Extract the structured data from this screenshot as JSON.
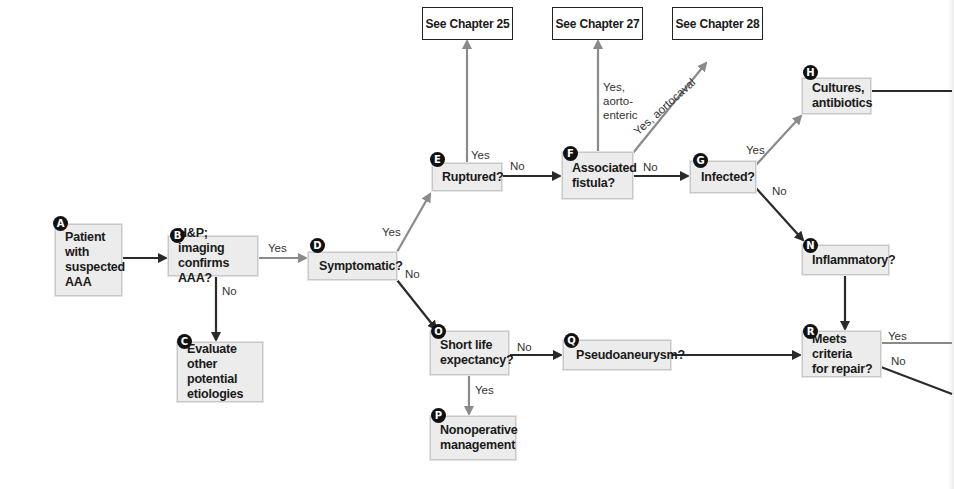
{
  "diagram": {
    "type": "flowchart",
    "nodes": [
      {
        "id": "A",
        "label": "Patient with suspected AAA",
        "lines": [
          "Patient",
          "with",
          "suspected",
          "AAA"
        ]
      },
      {
        "id": "B",
        "label": "H&P; imaging confirms AAA?",
        "lines": [
          "H&P; imaging",
          "confirms AAA?"
        ]
      },
      {
        "id": "C",
        "label": "Evaluate other potential etiologies",
        "lines": [
          "Evaluate other",
          "potential",
          "etiologies"
        ]
      },
      {
        "id": "D",
        "label": "Symptomatic?",
        "lines": [
          "Symptomatic?"
        ]
      },
      {
        "id": "E",
        "label": "Ruptured?",
        "lines": [
          "Ruptured?"
        ]
      },
      {
        "id": "F",
        "label": "Associated fistula?",
        "lines": [
          "Associated",
          "fistula?"
        ]
      },
      {
        "id": "G",
        "label": "Infected?",
        "lines": [
          "Infected?"
        ]
      },
      {
        "id": "H",
        "label": "Cultures, antibiotics",
        "lines": [
          "Cultures,",
          "antibiotics"
        ]
      },
      {
        "id": "N",
        "label": "Inflammatory?",
        "lines": [
          "Inflammatory?"
        ]
      },
      {
        "id": "O",
        "label": "Short life expectancy?",
        "lines": [
          "Short life",
          "expectancy?"
        ]
      },
      {
        "id": "P",
        "label": "Nonoperative management",
        "lines": [
          "Nonoperative",
          "management"
        ]
      },
      {
        "id": "Q",
        "label": "Pseudoaneurysm?",
        "lines": [
          "Pseudoaneurysm?"
        ]
      },
      {
        "id": "R",
        "label": "Meets criteria for repair?",
        "lines": [
          "Meets criteria",
          "for repair?"
        ]
      }
    ],
    "references": [
      {
        "id": "ch25",
        "label": "See Chapter 25"
      },
      {
        "id": "ch27",
        "label": "See Chapter 27"
      },
      {
        "id": "ch28",
        "label": "See Chapter 28"
      }
    ],
    "edge_labels": {
      "b_yes": "Yes",
      "b_no": "No",
      "d_yes": "Yes",
      "d_no": "No",
      "e_yes": "Yes",
      "e_no": "No",
      "f_yes_enteric_1": "Yes,",
      "f_yes_enteric_2": "aorto-",
      "f_yes_enteric_3": "enteric",
      "f_yes_caval": "Yes, aortocaval",
      "f_no": "No",
      "g_yes": "Yes",
      "g_no": "No",
      "o_no": "No",
      "o_yes": "Yes",
      "r_yes": "Yes",
      "r_no": "No"
    },
    "edges": [
      {
        "from": "A",
        "to": "B"
      },
      {
        "from": "B",
        "to": "D",
        "label": "Yes"
      },
      {
        "from": "B",
        "to": "C",
        "label": "No"
      },
      {
        "from": "D",
        "to": "E",
        "label": "Yes"
      },
      {
        "from": "D",
        "to": "O",
        "label": "No"
      },
      {
        "from": "E",
        "to": "ch25",
        "label": "Yes"
      },
      {
        "from": "E",
        "to": "F",
        "label": "No"
      },
      {
        "from": "F",
        "to": "ch27",
        "label": "Yes, aorto-enteric"
      },
      {
        "from": "F",
        "to": "ch28",
        "label": "Yes, aortocaval"
      },
      {
        "from": "F",
        "to": "G",
        "label": "No"
      },
      {
        "from": "G",
        "to": "H",
        "label": "Yes"
      },
      {
        "from": "G",
        "to": "N",
        "label": "No"
      },
      {
        "from": "N",
        "to": "R"
      },
      {
        "from": "O",
        "to": "Q",
        "label": "No"
      },
      {
        "from": "O",
        "to": "P",
        "label": "Yes"
      },
      {
        "from": "Q",
        "to": "R"
      },
      {
        "from": "H",
        "to": "(off-page)"
      },
      {
        "from": "R",
        "to": "(off-page)",
        "label": "Yes"
      },
      {
        "from": "R",
        "to": "(off-page)",
        "label": "No"
      }
    ],
    "colors": {
      "box_fill": "#ececec",
      "box_border": "#c8c8c8",
      "yes_line": "#8a8a8a",
      "no_line": "#2a2a2a",
      "badge": "#111111"
    }
  }
}
